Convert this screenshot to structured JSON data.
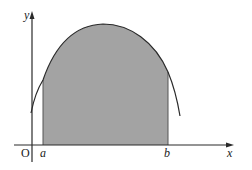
{
  "diagram": {
    "type": "area under curve",
    "labels": {
      "y_axis": "y",
      "x_axis": "x",
      "origin": "O",
      "lower_bound": "a",
      "upper_bound": "b"
    },
    "colors": {
      "shaded_region": "#a3a3a3",
      "curve": "#2a2a2a",
      "axes": "#2a2a2a"
    }
  }
}
